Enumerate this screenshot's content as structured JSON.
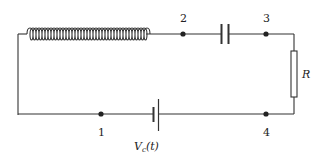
{
  "diagram": {
    "type": "circuit",
    "components": [
      {
        "id": "inductor",
        "kind": "inductor",
        "label": ""
      },
      {
        "id": "capacitor",
        "kind": "capacitor",
        "label": ""
      },
      {
        "id": "resistor",
        "kind": "resistor",
        "label": "R"
      },
      {
        "id": "source",
        "kind": "voltage-source",
        "label_main": "V",
        "label_sub": "c",
        "label_arg": "(t)"
      }
    ],
    "nodes": [
      {
        "id": "n1",
        "label": "1"
      },
      {
        "id": "n2",
        "label": "2"
      },
      {
        "id": "n3",
        "label": "3"
      },
      {
        "id": "n4",
        "label": "4"
      }
    ],
    "colors": {
      "wire": "#333333",
      "background": "#ffffff"
    }
  }
}
